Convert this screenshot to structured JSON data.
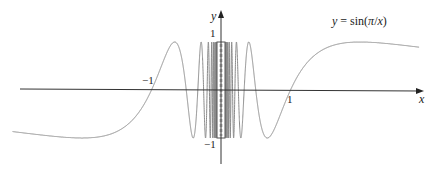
{
  "chart_data": {
    "type": "line",
    "title": "",
    "function": "sin(pi/x)",
    "equation_label": {
      "prefix": "y = sin(",
      "pi": "π",
      "slash": "/",
      "var": "x",
      "suffix": ")"
    },
    "xlabel": "x",
    "ylabel": "y",
    "x_ticks": [
      {
        "value": -1,
        "label": "−1"
      },
      {
        "value": 1,
        "label": "1"
      }
    ],
    "y_ticks": [
      {
        "value": 1,
        "label": "1"
      },
      {
        "value": -1,
        "label": "−1"
      }
    ],
    "xlim": [
      -3.0,
      2.85
    ],
    "ylim": [
      -1,
      1
    ],
    "grid": false,
    "legend": "none",
    "series": [
      {
        "name": "y = sin(π/x)",
        "sample_points": [
          {
            "x": -3.0,
            "y": -0.866
          },
          {
            "x": -2.0,
            "y": -1.0
          },
          {
            "x": -1.0,
            "y": 0.0
          },
          {
            "x": -0.667,
            "y": 1.0
          },
          {
            "x": -0.5,
            "y": 0.0
          },
          {
            "x": -0.4,
            "y": -1.0
          },
          {
            "x": 0.4,
            "y": 1.0
          },
          {
            "x": 0.5,
            "y": 0.0
          },
          {
            "x": 0.667,
            "y": -1.0
          },
          {
            "x": 1.0,
            "y": 0.0
          },
          {
            "x": 2.0,
            "y": 1.0
          },
          {
            "x": 2.85,
            "y": 0.93
          }
        ]
      }
    ],
    "colors": {
      "curve": "#8a8a8a",
      "axis": "#333333",
      "text": "#222222"
    }
  }
}
